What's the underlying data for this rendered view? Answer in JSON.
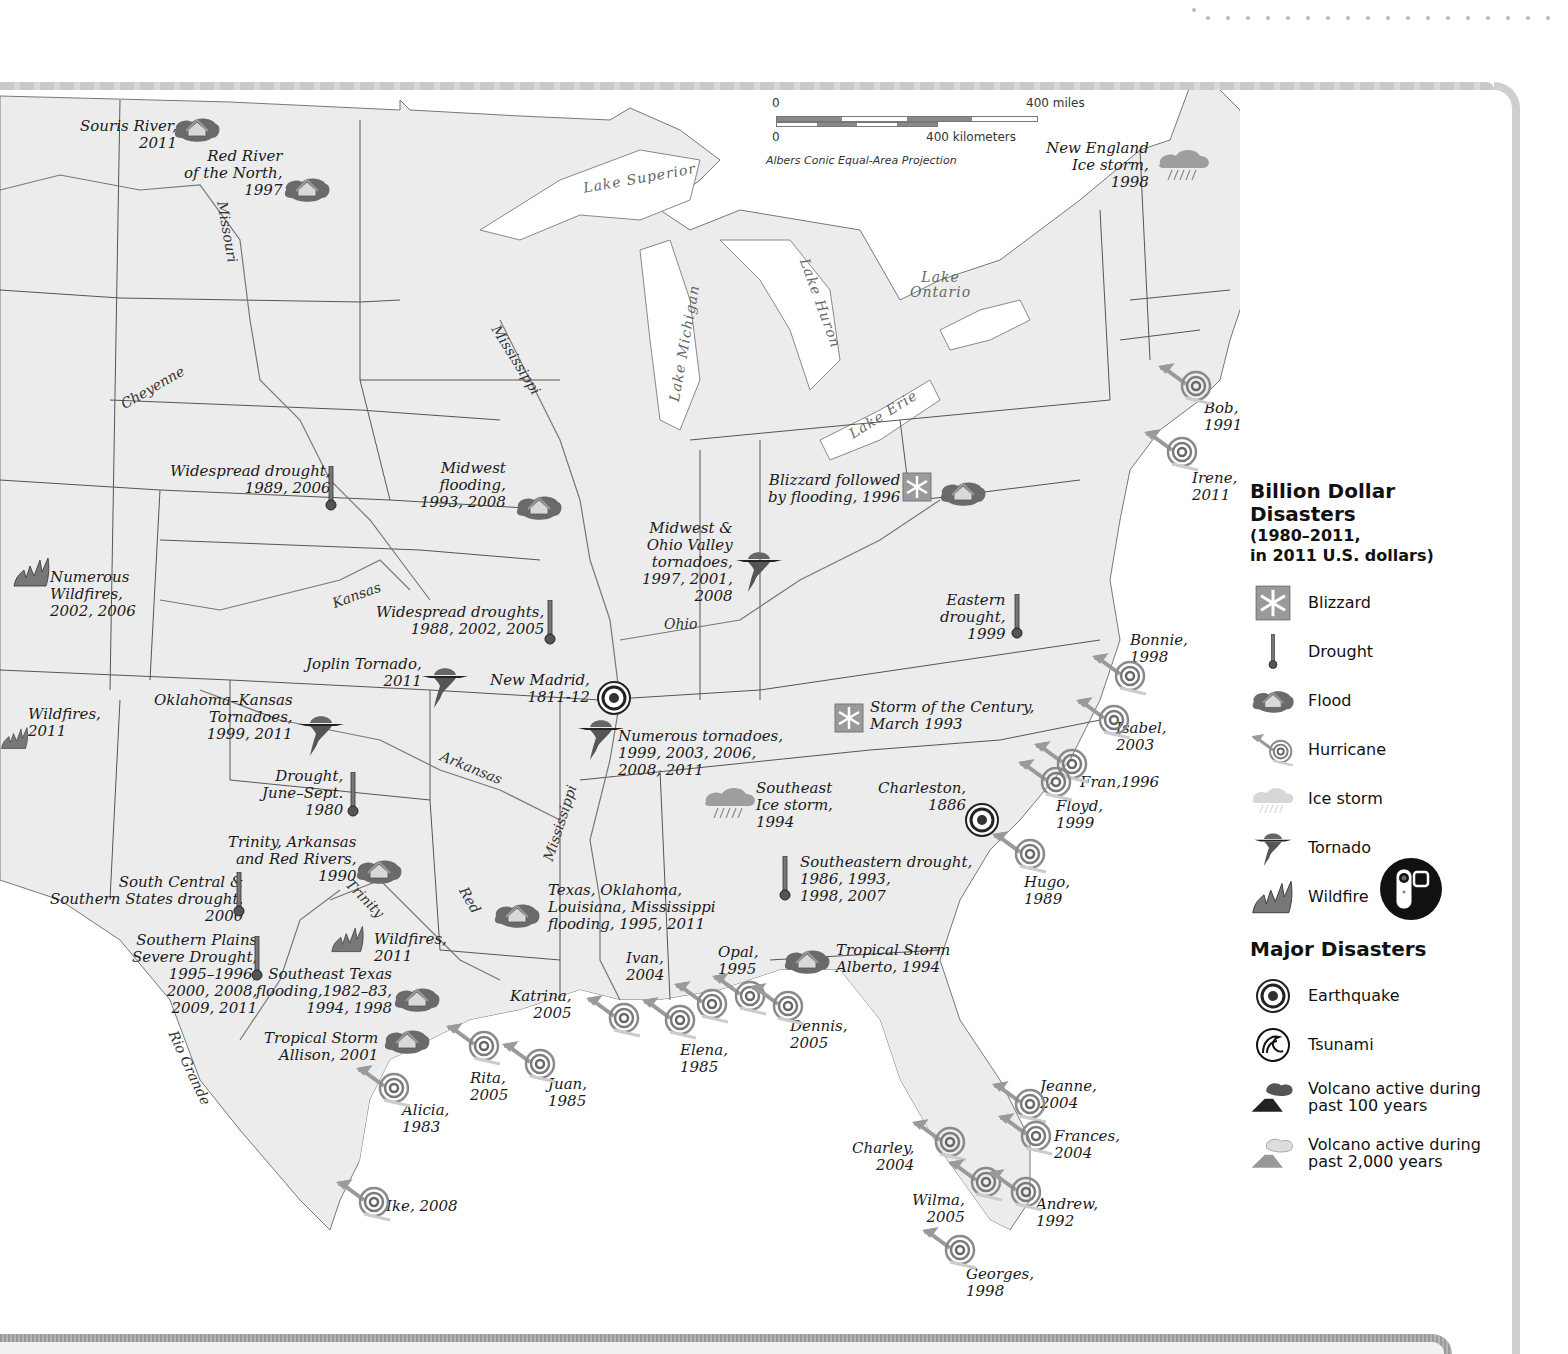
{
  "scale": {
    "miles_zero": "0",
    "miles_label": "400 miles",
    "km_zero": "0",
    "km_label": "400 kilometers",
    "projection": "Albers Conic Equal-Area Projection"
  },
  "legend": {
    "title_line1": "Billion Dollar",
    "title_line2": "Disasters",
    "subtitle_line1": "(1980–2011,",
    "subtitle_line2": "in 2011 U.S. dollars)",
    "billion_items": [
      {
        "icon": "blizzard-icon",
        "label": "Blizzard"
      },
      {
        "icon": "drought-icon",
        "label": "Drought"
      },
      {
        "icon": "flood-icon",
        "label": "Flood"
      },
      {
        "icon": "hurricane-icon",
        "label": "Hurricane"
      },
      {
        "icon": "ice-storm-icon",
        "label": "Ice storm"
      },
      {
        "icon": "tornado-icon",
        "label": "Tornado"
      },
      {
        "icon": "wildfire-icon",
        "label": "Wildfire"
      }
    ],
    "major_title": "Major Disasters",
    "major_items": [
      {
        "icon": "earthquake-icon",
        "label": "Earthquake"
      },
      {
        "icon": "tsunami-icon",
        "label": "Tsunami"
      },
      {
        "icon": "volcano-100-icon",
        "label": "Volcano active during\npast 100 years"
      },
      {
        "icon": "volcano-2000-icon",
        "label": "Volcano active during\npast 2,000 years"
      }
    ]
  },
  "features": {
    "rivers": [
      "Missouri",
      "Cheyenne",
      "Mississippi",
      "Kansas",
      "Arkansas",
      "Ohio",
      "Mississippi",
      "Red",
      "Trinity",
      "Rio Grande"
    ],
    "lakes": [
      "Lake Superior",
      "Lake Michigan",
      "Lake Huron",
      "Lake Erie",
      "Lake\nOntario"
    ]
  },
  "events": [
    {
      "type": "flood",
      "label": "Souris River,\n2011"
    },
    {
      "type": "flood",
      "label": "Red River\nof the North,\n1997"
    },
    {
      "type": "drought",
      "label": "Widespread drought,\n1989, 2006"
    },
    {
      "type": "flood",
      "label": "Midwest\nflooding,\n1993, 2008"
    },
    {
      "type": "wildfire",
      "label": "Numerous\nWildfires,\n2002, 2006"
    },
    {
      "type": "drought",
      "label": "Widespread droughts,\n1988, 2002, 2005"
    },
    {
      "type": "tornado",
      "label": "Midwest &\nOhio Valley\ntornadoes,\n1997, 2001,\n2008"
    },
    {
      "type": "blizzard",
      "label": "Blizzard followed\nby flooding, 1996"
    },
    {
      "type": "tornado",
      "label": "Joplin Tornado,\n2011"
    },
    {
      "type": "earthquake",
      "label": "New Madrid,\n1811-12"
    },
    {
      "type": "wildfire",
      "label": "Wildfires,\n2011"
    },
    {
      "type": "tornado",
      "label": "Oklahoma–Kansas\nTornadoes,\n1999, 2011"
    },
    {
      "type": "tornado",
      "label": "Numerous tornadoes,\n1999, 2003, 2006,\n2008, 2011"
    },
    {
      "type": "drought",
      "label": "Eastern\ndrought,\n1999"
    },
    {
      "type": "blizzard",
      "label": "Storm of the Century,\nMarch 1993"
    },
    {
      "type": "drought",
      "label": "Drought,\nJune–Sept.\n1980"
    },
    {
      "type": "ice-storm",
      "label": "Southeast\nIce storm,\n1994"
    },
    {
      "type": "earthquake",
      "label": "Charleston,\n1886"
    },
    {
      "type": "flood",
      "label": "Trinity, Arkansas\nand Red Rivers,\n1990"
    },
    {
      "type": "drought",
      "label": "South Central &\nSouthern States drought,\n2000"
    },
    {
      "type": "drought",
      "label": "Southeastern drought,\n1986, 1993,\n1998, 2007"
    },
    {
      "type": "flood",
      "label": "Texas, Oklahoma,\nLouisiana, Mississippi\nflooding, 1995, 2011"
    },
    {
      "type": "drought",
      "label": "Southern Plains\nSevere Drought,\n1995–1996,\n2000, 2008,\n2009, 2011"
    },
    {
      "type": "wildfire",
      "label": "Wildfires,\n2011"
    },
    {
      "type": "flood",
      "label": "Southeast Texas\nflooding,1982–83,\n1994, 1998"
    },
    {
      "type": "flood",
      "label": "Tropical Storm\nAllison, 2001"
    },
    {
      "type": "flood",
      "label": "Tropical Storm\nAlberto, 1994"
    },
    {
      "type": "ice-storm",
      "label": "New England\nIce storm,\n1998"
    },
    {
      "type": "hurricane",
      "label": "Bob,\n1991"
    },
    {
      "type": "hurricane",
      "label": "Irene,\n2011"
    },
    {
      "type": "hurricane",
      "label": "Bonnie,\n1998"
    },
    {
      "type": "hurricane",
      "label": "Isabel,\n2003"
    },
    {
      "type": "hurricane",
      "label": "Fran,1996"
    },
    {
      "type": "hurricane",
      "label": "Floyd,\n1999"
    },
    {
      "type": "hurricane",
      "label": "Hugo,\n1989"
    },
    {
      "type": "hurricane",
      "label": "Ivan,\n2004"
    },
    {
      "type": "hurricane",
      "label": "Opal,\n1995"
    },
    {
      "type": "hurricane",
      "label": "Katrina,\n2005"
    },
    {
      "type": "hurricane",
      "label": "Elena,\n1985"
    },
    {
      "type": "hurricane",
      "label": "Dennis,\n2005"
    },
    {
      "type": "hurricane",
      "label": "Rita,\n2005"
    },
    {
      "type": "hurricane",
      "label": "Juan,\n1985"
    },
    {
      "type": "hurricane",
      "label": "Alicia,\n1983"
    },
    {
      "type": "hurricane",
      "label": "Ike, 2008"
    },
    {
      "type": "hurricane",
      "label": "Jeanne,\n2004"
    },
    {
      "type": "hurricane",
      "label": "Frances,\n2004"
    },
    {
      "type": "hurricane",
      "label": "Charley,\n2004"
    },
    {
      "type": "hurricane",
      "label": "Andrew,\n1992"
    },
    {
      "type": "hurricane",
      "label": "Wilma,\n2005"
    },
    {
      "type": "hurricane",
      "label": "Georges,\n1998"
    }
  ],
  "colors": {
    "land": "#ececec",
    "water": "#ffffff",
    "border": "#555555",
    "river": "#666666",
    "frame": "#cfcfcf"
  }
}
